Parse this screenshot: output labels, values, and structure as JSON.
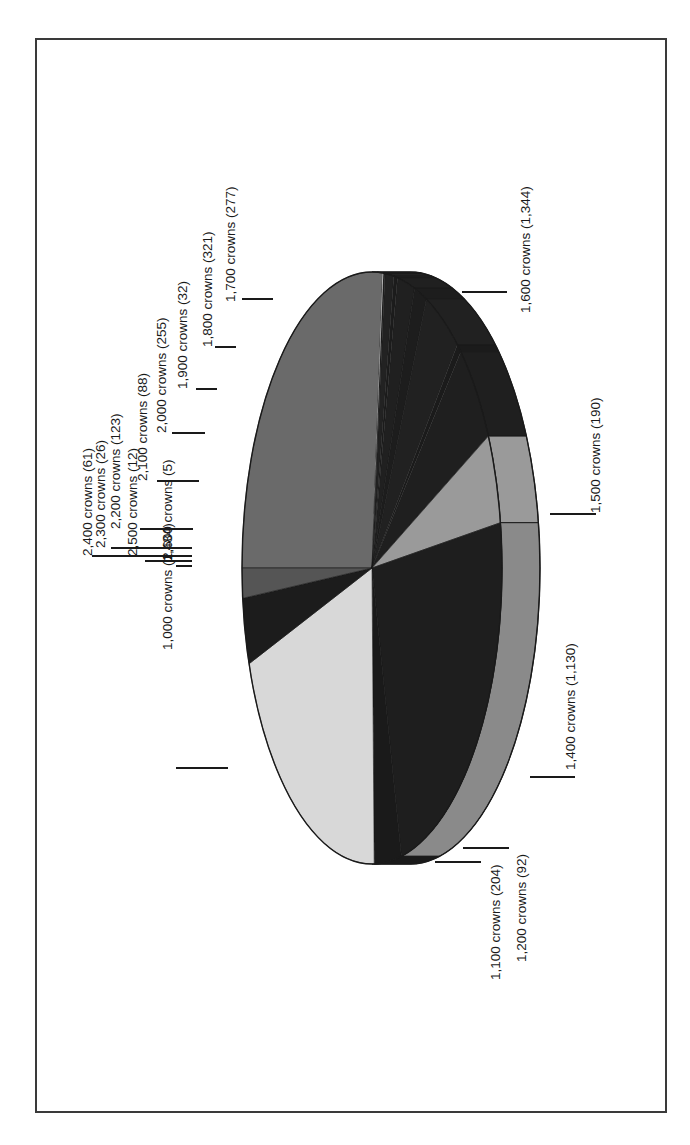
{
  "chart_data": {
    "type": "pie",
    "style": "3d-pie, rotated 90deg counter-clockwise, greyscale",
    "title": "",
    "unit_label": "crowns",
    "legend": "none (direct labels with leader lines)",
    "slices": [
      {
        "category": "1,000 crowns",
        "value": 1484,
        "label": "1,000  crowns (1,484)",
        "color": "#6a6a6a"
      },
      {
        "category": "2,600 crowns",
        "value": 5,
        "label": "2,600 crowns (5)",
        "color": "#cfcfcf"
      },
      {
        "category": "2,500 crowns",
        "value": 12,
        "label": "2,500 crowns (12)",
        "color": "#1e1e1e"
      },
      {
        "category": "2,400 crowns",
        "value": 61,
        "label": "2,400 crowns (61)",
        "color": "#222222"
      },
      {
        "category": "2,300 crowns",
        "value": 26,
        "label": "2,300 crowns (26)",
        "color": "#1c1c1c"
      },
      {
        "category": "2,200 crowns",
        "value": 123,
        "label": "2,200 crowns (123)",
        "color": "#202020"
      },
      {
        "category": "2,100 crowns",
        "value": 88,
        "label": "2,100 crowns (88)",
        "color": "#1d1d1d"
      },
      {
        "category": "2,000 crowns",
        "value": 255,
        "label": "2,000 crowns (255)",
        "color": "#212121"
      },
      {
        "category": "1,900 crowns",
        "value": 32,
        "label": "1,900 crowns (32)",
        "color": "#1b1b1b"
      },
      {
        "category": "1,800 crowns",
        "value": 321,
        "label": "1,800 crowns (321)",
        "color": "#1f1f1f"
      },
      {
        "category": "1,700 crowns",
        "value": 277,
        "label": "1,700 crowns (277)",
        "color": "#9a9a9a"
      },
      {
        "category": "1,600 crowns",
        "value": 1344,
        "label": "1,600 crowns (1,344)",
        "color": "#1e1e1e"
      },
      {
        "category": "1,500 crowns",
        "value": 190,
        "label": "1,500 crowns (190)",
        "color": "#1a1a1a"
      },
      {
        "category": "1,400 crowns",
        "value": 1130,
        "label": "1,400 crowns (1,130)",
        "color": "#d8d8d8"
      },
      {
        "category": "1,100 crowns",
        "value": 204,
        "label": "1,100 crowns (204)",
        "color": "#1c1c1c"
      },
      {
        "category": "1,200 crowns",
        "value": 92,
        "label": "1,200 crowns (92)",
        "color": "#555555"
      }
    ],
    "side_colors": {
      "1,000 crowns": "#5e5e5e",
      "1,600 crowns": "#8a8a8a",
      "1,500 crowns": "#1a1a1a",
      "1,400 crowns": "#6e6e6e",
      "1,100 crowns": "#2a2a2a",
      "1,200 crowns": "#575757"
    },
    "label_positions": [
      {
        "text": "1,000  crowns (1,484)",
        "x": 172,
        "y": 650,
        "leader": [
          176,
          768,
          228,
          768
        ]
      },
      {
        "text": "2,600 crowns (5)",
        "x": 172,
        "y": 560,
        "leader": [
          176,
          566,
          192,
          566
        ]
      },
      {
        "text": "2,500 crowns (12)",
        "x": 137,
        "y": 556,
        "leader": [
          145,
          561,
          192,
          561
        ]
      },
      {
        "text": "2,400 crowns (61)",
        "x": 92,
        "y": 556,
        "leader": [
          92,
          556,
          192,
          556
        ]
      },
      {
        "text": "2,300 crowns (26)",
        "x": 105,
        "y": 548,
        "leader": [
          111,
          548,
          192,
          548
        ]
      },
      {
        "text": "2,200 crowns (123)",
        "x": 120,
        "y": 529,
        "leader": [
          140,
          529,
          193,
          529
        ]
      },
      {
        "text": "2,100 crowns (88)",
        "x": 147,
        "y": 481,
        "leader": [
          157,
          481,
          199,
          481
        ]
      },
      {
        "text": "2,000 crowns (255)",
        "x": 166,
        "y": 433,
        "leader": [
          172,
          433,
          205,
          433
        ]
      },
      {
        "text": "1,900 crowns (32)",
        "x": 187,
        "y": 389,
        "leader": [
          196,
          389,
          217,
          389
        ]
      },
      {
        "text": "1,800 crowns (321)",
        "x": 212,
        "y": 347,
        "leader": [
          215,
          347,
          236,
          347
        ]
      },
      {
        "text": "1,700 crowns (277)",
        "x": 235,
        "y": 302,
        "leader": [
          242,
          299,
          273,
          299
        ]
      },
      {
        "text": "1,600 crowns (1,344)",
        "x": 530,
        "y": 313,
        "leader": [
          462,
          292,
          507,
          292
        ]
      },
      {
        "text": "1,500 crowns (190)",
        "x": 600,
        "y": 513,
        "leader": [
          550,
          514,
          596,
          514
        ]
      },
      {
        "text": "1,400 crowns (1,130)",
        "x": 575,
        "y": 770,
        "leader": [
          530,
          777,
          575,
          777
        ]
      },
      {
        "text": "1,100 crowns (204)",
        "x": 500,
        "y": 980,
        "leader": [
          435,
          862,
          481,
          862
        ]
      },
      {
        "text": "1,200 crowns (92)",
        "x": 526,
        "y": 962,
        "leader": [
          463,
          848,
          509,
          848
        ]
      }
    ],
    "total": 5654
  }
}
